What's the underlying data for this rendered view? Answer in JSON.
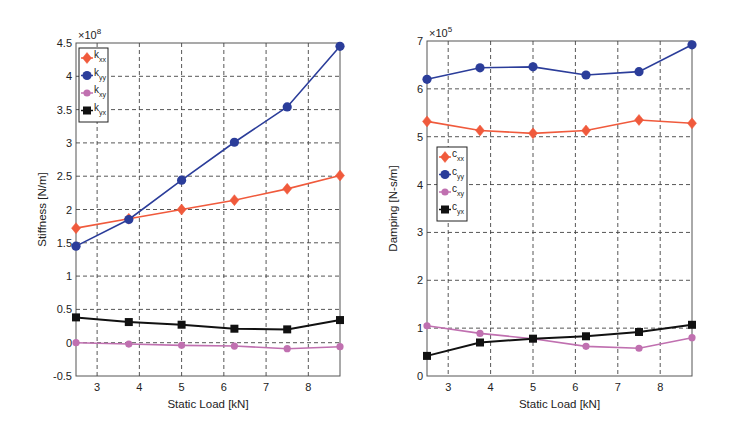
{
  "chart_data": [
    {
      "type": "line",
      "title": "",
      "xlabel": "Static Load [kN]",
      "ylabel": "Stiffness [N/m]",
      "y_multiplier": "×10^8",
      "x": [
        2.5,
        3.75,
        5,
        6.25,
        7.5,
        8.75
      ],
      "xlim": [
        2.5,
        8.75
      ],
      "ylim": [
        -0.5,
        4.5
      ],
      "xticks": [
        3,
        4,
        5,
        6,
        7,
        8
      ],
      "yticks": [
        -0.5,
        0,
        0.5,
        1,
        1.5,
        2,
        2.5,
        3,
        3.5,
        4,
        4.5
      ],
      "grid": true,
      "legend_position": "upper left",
      "series": [
        {
          "name": "k_xx",
          "base": "k",
          "sub": "xx",
          "color": "#f05a3c",
          "marker": "diamond",
          "values": [
            1.72,
            1.86,
            2.0,
            2.14,
            2.31,
            2.51
          ]
        },
        {
          "name": "k_yy",
          "base": "k",
          "sub": "yy",
          "color": "#2b3d9a",
          "marker": "circle",
          "values": [
            1.45,
            1.85,
            2.44,
            3.01,
            3.54,
            4.45
          ]
        },
        {
          "name": "k_xy",
          "base": "k",
          "sub": "xy",
          "color": "#c070b0",
          "marker": "circle",
          "values": [
            0.0,
            -0.02,
            -0.04,
            -0.05,
            -0.09,
            -0.06
          ]
        },
        {
          "name": "k_yx",
          "base": "k",
          "sub": "yx",
          "color": "#111111",
          "marker": "square",
          "values": [
            0.38,
            0.31,
            0.27,
            0.21,
            0.2,
            0.34
          ]
        }
      ]
    },
    {
      "type": "line",
      "title": "",
      "xlabel": "Static Load [kN]",
      "ylabel": "Damping [N-s/m]",
      "y_multiplier": "×10^5",
      "x": [
        2.5,
        3.75,
        5,
        6.25,
        7.5,
        8.75
      ],
      "xlim": [
        2.5,
        8.75
      ],
      "ylim": [
        0,
        7
      ],
      "xticks": [
        3,
        4,
        5,
        6,
        7,
        8
      ],
      "yticks": [
        0,
        1,
        2,
        3,
        4,
        5,
        6,
        7
      ],
      "grid": true,
      "legend_position": "center left",
      "series": [
        {
          "name": "c_xx",
          "base": "c",
          "sub": "xx",
          "color": "#f05a3c",
          "marker": "diamond",
          "values": [
            5.32,
            5.13,
            5.07,
            5.13,
            5.35,
            5.28
          ]
        },
        {
          "name": "c_yy",
          "base": "c",
          "sub": "yy",
          "color": "#2b3d9a",
          "marker": "circle",
          "values": [
            6.2,
            6.44,
            6.46,
            6.29,
            6.36,
            6.92
          ]
        },
        {
          "name": "c_xy",
          "base": "c",
          "sub": "xy",
          "color": "#c070b0",
          "marker": "circle",
          "values": [
            1.05,
            0.89,
            0.78,
            0.62,
            0.58,
            0.8
          ]
        },
        {
          "name": "c_yx",
          "base": "c",
          "sub": "yx",
          "color": "#111111",
          "marker": "square",
          "values": [
            0.42,
            0.7,
            0.78,
            0.83,
            0.92,
            1.07
          ]
        }
      ]
    }
  ],
  "layout": {
    "charts": [
      {
        "left": 76,
        "right": 340,
        "top": 43,
        "bottom": 376,
        "legend": {
          "x": 79,
          "y": 48,
          "w": 29,
          "h": 74
        }
      },
      {
        "left": 427,
        "right": 692,
        "top": 41,
        "bottom": 376,
        "legend": {
          "x": 437,
          "y": 147,
          "w": 30,
          "h": 74
        }
      }
    ]
  }
}
